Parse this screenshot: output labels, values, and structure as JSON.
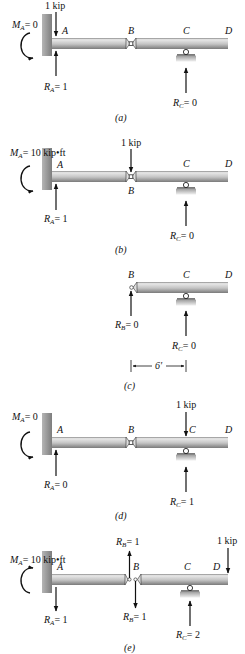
{
  "figure": {
    "panels": [
      {
        "id": "a",
        "caption": "(a)",
        "moment": {
          "label": "M",
          "sub": "A",
          "value": "= 0"
        },
        "load": {
          "label": "1 kip",
          "at": "A"
        },
        "nodes": [
          "A",
          "B",
          "C",
          "D"
        ],
        "reactions": [
          {
            "label": "R",
            "sub": "A",
            "value": "= 1"
          },
          {
            "label": "R",
            "sub": "C",
            "value": "= 0"
          }
        ]
      },
      {
        "id": "b",
        "caption": "(b)",
        "moment": {
          "label": "M",
          "sub": "A",
          "value": "= 10 kip•ft"
        },
        "load": {
          "label": "1 kip",
          "at": "B"
        },
        "nodes": [
          "A",
          "B",
          "C",
          "D"
        ],
        "reactions": [
          {
            "label": "R",
            "sub": "A",
            "value": "= 1"
          },
          {
            "label": "R",
            "sub": "C",
            "value": "= 0"
          }
        ]
      },
      {
        "id": "c",
        "caption": "(c)",
        "nodes": [
          "B",
          "C",
          "D"
        ],
        "reactions": [
          {
            "label": "R",
            "sub": "B",
            "value": "= 0"
          },
          {
            "label": "R",
            "sub": "C",
            "value": "= 0"
          }
        ],
        "dimension": "6′"
      },
      {
        "id": "d",
        "caption": "(d)",
        "moment": {
          "label": "M",
          "sub": "A",
          "value": "= 0"
        },
        "load": {
          "label": "1 kip",
          "at": "C"
        },
        "nodes": [
          "A",
          "B",
          "C",
          "D"
        ],
        "reactions": [
          {
            "label": "R",
            "sub": "A",
            "value": "= 0"
          },
          {
            "label": "R",
            "sub": "C",
            "value": "= 1"
          }
        ]
      },
      {
        "id": "e",
        "caption": "(e)",
        "moment": {
          "label": "M",
          "sub": "A",
          "value": "= 10 kip•ft"
        },
        "load": {
          "label": "1 kip",
          "at": "D"
        },
        "nodes": [
          "A",
          "B",
          "C",
          "D"
        ],
        "reactions": [
          {
            "label": "R",
            "sub": "A",
            "value": "= 1"
          },
          {
            "label": "R",
            "sub": "B",
            "value": "= 1",
            "direction": "up"
          },
          {
            "label": "R",
            "sub": "B",
            "value": "= 1",
            "direction": "down"
          },
          {
            "label": "R",
            "sub": "C",
            "value": "= 2"
          }
        ]
      }
    ],
    "colors": {
      "beam_top": "#e6e6e6",
      "beam_mid": "#b8b8b8",
      "beam_edge": "#333333",
      "wall": "#8f8f8f",
      "ground": "#c8c8c8",
      "ink": "#111111"
    }
  }
}
